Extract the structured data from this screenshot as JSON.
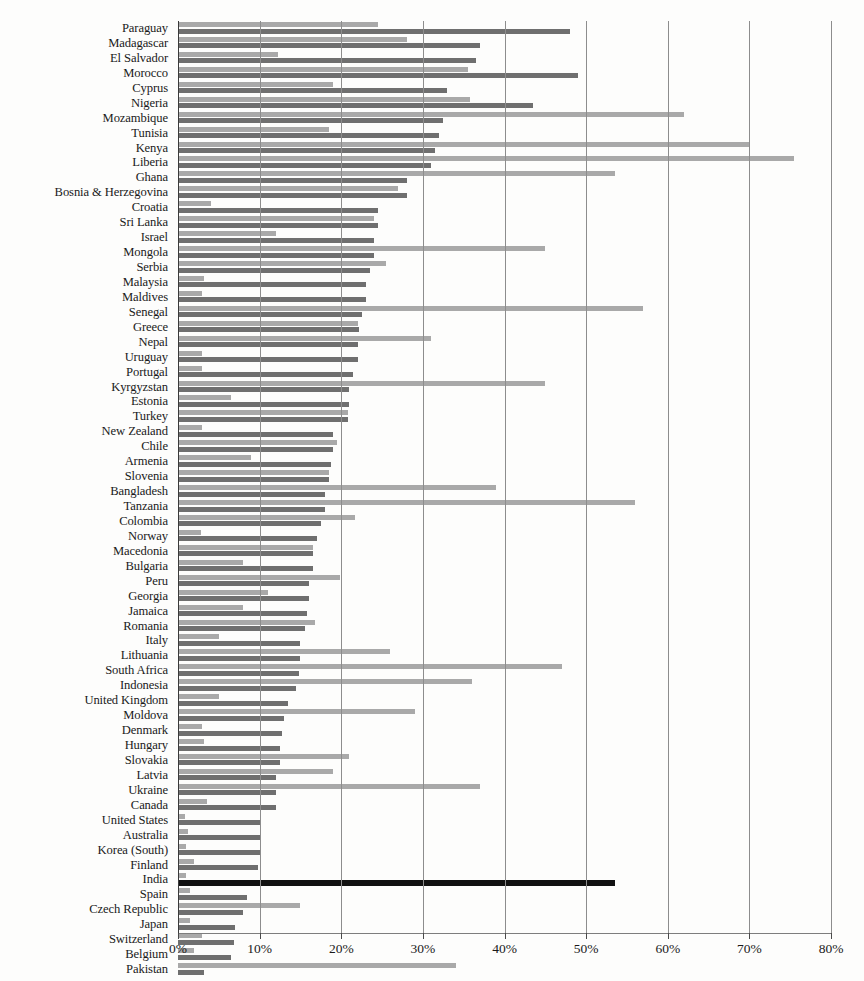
{
  "chart_data": {
    "type": "bar",
    "orientation": "horizontal",
    "title": "",
    "subtitle": "",
    "xlabel": "",
    "ylabel": "",
    "xlim": [
      0,
      80
    ],
    "xunit": "%",
    "xticks": [
      0,
      10,
      20,
      30,
      40,
      50,
      60,
      70,
      80
    ],
    "xticklabels": [
      "0%",
      "10%",
      "20%",
      "30%",
      "40%",
      "50%",
      "60%",
      "70%",
      "80%"
    ],
    "grid": "vertical",
    "legend": "none",
    "highlight_category": "India",
    "colors": {
      "series_light": "#a9a9a9",
      "series_dark": "#6f6f6f",
      "highlight": "#111111",
      "gridline": "#8d8d8d",
      "background": "#fdfdfc"
    },
    "categories": [
      "Paraguay",
      "Madagascar",
      "El Salvador",
      "Morocco",
      "Cyprus",
      "Nigeria",
      "Mozambique",
      "Tunisia",
      "Kenya",
      "Liberia",
      "Ghana",
      "Bosnia & Herzegovina",
      "Croatia",
      "Sri Lanka",
      "Israel",
      "Mongola",
      "Serbia",
      "Malaysia",
      "Maldives",
      "Senegal",
      "Greece",
      "Nepal",
      "Uruguay",
      "Portugal",
      "Kyrgyzstan",
      "Estonia",
      "Turkey",
      "New Zealand",
      "Chile",
      "Armenia",
      "Slovenia",
      "Bangladesh",
      "Tanzania",
      "Colombia",
      "Norway",
      "Macedonia",
      "Bulgaria",
      "Peru",
      "Georgia",
      "Jamaica",
      "Romania",
      "Italy",
      "Lithuania",
      "South Africa",
      "Indonesia",
      "United Kingdom",
      "Moldova",
      "Denmark",
      "Hungary",
      "Slovakia",
      "Latvia",
      "Ukraine",
      "Canada",
      "United States",
      "Australia",
      "Korea (South)",
      "Finland",
      "India",
      "Spain",
      "Czech Republic",
      "Japan",
      "Switzerland",
      "Belgium",
      "Pakistan"
    ],
    "series": [
      {
        "name": "light",
        "values": [
          24.5,
          28.0,
          12.2,
          35.5,
          19.0,
          35.8,
          62.0,
          18.5,
          70.0,
          75.5,
          53.5,
          27.0,
          4.0,
          24.0,
          12.0,
          45.0,
          25.5,
          3.2,
          3.0,
          57.0,
          22.0,
          31.0,
          3.0,
          3.0,
          45.0,
          6.5,
          20.8,
          3.0,
          19.5,
          9.0,
          18.5,
          39.0,
          56.0,
          21.7,
          2.8,
          16.5,
          8.0,
          19.8,
          11.0,
          8.0,
          16.8,
          5.0,
          26.0,
          47.0,
          36.0,
          5.0,
          29.0,
          3.0,
          3.2,
          21.0,
          19.0,
          37.0,
          3.5,
          0.8,
          1.2,
          1.0,
          2.0,
          1.0,
          1.5,
          15.0,
          1.5,
          3.0,
          2.0,
          34.0
        ]
      },
      {
        "name": "dark",
        "values": [
          48.0,
          37.0,
          36.5,
          49.0,
          33.0,
          43.5,
          32.5,
          32.0,
          31.5,
          31.0,
          28.0,
          28.0,
          24.5,
          24.5,
          24.0,
          24.0,
          23.5,
          23.0,
          23.0,
          22.5,
          22.2,
          22.0,
          22.0,
          21.5,
          21.0,
          21.0,
          20.8,
          19.0,
          19.0,
          18.8,
          18.5,
          18.0,
          18.0,
          17.5,
          17.0,
          16.5,
          16.5,
          16.0,
          16.0,
          15.8,
          15.5,
          15.0,
          15.0,
          14.8,
          14.5,
          13.5,
          13.0,
          12.8,
          12.5,
          12.5,
          12.0,
          12.0,
          12.0,
          10.0,
          10.0,
          10.0,
          9.8,
          53.5,
          8.5,
          8.0,
          7.0,
          6.8,
          6.5,
          3.2
        ]
      }
    ]
  }
}
